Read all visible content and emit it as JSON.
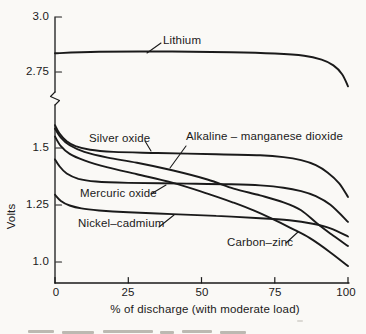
{
  "figure": {
    "background": "#faf9f6",
    "ink": "#1a1a1a",
    "ylabel": "Volts",
    "xlabel": "% of discharge (with moderate load)",
    "y_ticks": [
      {
        "label": "3.0",
        "volts": 3.0
      },
      {
        "label": "2.75",
        "volts": 2.75
      },
      {
        "label": "1.5",
        "volts": 1.5
      },
      {
        "label": "1.25",
        "volts": 1.25
      },
      {
        "label": "1.0",
        "volts": 1.0
      }
    ],
    "x_ticks": [
      {
        "label": "0",
        "pct": 0
      },
      {
        "label": "25",
        "pct": 25
      },
      {
        "label": "50",
        "pct": 50
      },
      {
        "label": "75",
        "pct": 75
      },
      {
        "label": "100",
        "pct": 100
      }
    ],
    "axis_break": true
  },
  "chart_data": {
    "type": "line",
    "title": "",
    "xlabel": "% of discharge (with moderate load)",
    "ylabel": "Volts",
    "x_range": [
      0,
      100
    ],
    "x_ticks": [
      0,
      25,
      50,
      75,
      100
    ],
    "y_ticks": [
      1.0,
      1.25,
      1.5,
      2.75,
      3.0
    ],
    "axis_break_between_volts": [
      1.68,
      2.62
    ],
    "grid": false,
    "legend": "inline-labels-with-leader-lines",
    "series": [
      {
        "name": "Lithium",
        "points": [
          [
            0,
            2.835
          ],
          [
            15,
            2.842
          ],
          [
            40,
            2.843
          ],
          [
            60,
            2.84
          ],
          [
            75,
            2.834
          ],
          [
            85,
            2.824
          ],
          [
            91,
            2.806
          ],
          [
            95,
            2.78
          ],
          [
            98,
            2.74
          ],
          [
            100,
            2.685
          ]
        ]
      },
      {
        "name": "Silver oxide",
        "points": [
          [
            0,
            1.6
          ],
          [
            1.5,
            1.565
          ],
          [
            4,
            1.53
          ],
          [
            7,
            1.508
          ],
          [
            12,
            1.492
          ],
          [
            20,
            1.483
          ],
          [
            35,
            1.478
          ],
          [
            55,
            1.473
          ],
          [
            70,
            1.468
          ],
          [
            78,
            1.46
          ],
          [
            84,
            1.447
          ],
          [
            89,
            1.425
          ],
          [
            93,
            1.393
          ],
          [
            97,
            1.345
          ],
          [
            100,
            1.285
          ]
        ]
      },
      {
        "name": "Alkaline – manganese dioxide",
        "points": [
          [
            0,
            1.585
          ],
          [
            2,
            1.545
          ],
          [
            5,
            1.512
          ],
          [
            10,
            1.483
          ],
          [
            18,
            1.458
          ],
          [
            28,
            1.435
          ],
          [
            40,
            1.402
          ],
          [
            52,
            1.362
          ],
          [
            61,
            1.322
          ],
          [
            70,
            1.292
          ],
          [
            78,
            1.262
          ],
          [
            84,
            1.227
          ],
          [
            90,
            1.163
          ],
          [
            95,
            1.115
          ],
          [
            100,
            1.07
          ]
        ]
      },
      {
        "name": "Mercuric oxide",
        "points": [
          [
            0,
            1.45
          ],
          [
            1.5,
            1.42
          ],
          [
            4,
            1.388
          ],
          [
            8,
            1.365
          ],
          [
            14,
            1.353
          ],
          [
            25,
            1.347
          ],
          [
            45,
            1.344
          ],
          [
            60,
            1.341
          ],
          [
            70,
            1.336
          ],
          [
            78,
            1.326
          ],
          [
            84,
            1.311
          ],
          [
            89,
            1.289
          ],
          [
            94,
            1.251
          ],
          [
            100,
            1.176
          ]
        ]
      },
      {
        "name": "Nickel–cadmium",
        "points": [
          [
            0,
            1.295
          ],
          [
            2,
            1.268
          ],
          [
            5,
            1.248
          ],
          [
            9,
            1.235
          ],
          [
            15,
            1.226
          ],
          [
            25,
            1.218
          ],
          [
            40,
            1.21
          ],
          [
            55,
            1.202
          ],
          [
            70,
            1.192
          ],
          [
            80,
            1.183
          ],
          [
            88,
            1.168
          ],
          [
            94,
            1.148
          ],
          [
            100,
            1.112
          ]
        ]
      },
      {
        "name": "Carbon–zinc",
        "points": [
          [
            0,
            1.55
          ],
          [
            2,
            1.508
          ],
          [
            5,
            1.474
          ],
          [
            10,
            1.446
          ],
          [
            18,
            1.415
          ],
          [
            28,
            1.385
          ],
          [
            40,
            1.348
          ],
          [
            52,
            1.3
          ],
          [
            61,
            1.26
          ],
          [
            68,
            1.225
          ],
          [
            74,
            1.19
          ],
          [
            80,
            1.152
          ],
          [
            87,
            1.105
          ],
          [
            94,
            1.042
          ],
          [
            100,
            0.982
          ]
        ]
      }
    ]
  }
}
